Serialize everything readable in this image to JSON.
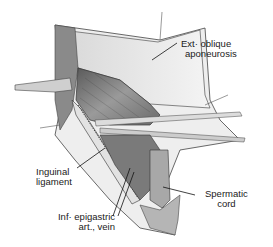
{
  "figure": {
    "labels": [
      {
        "id": "ext-oblique",
        "lines": [
          "Ext· oblique",
          "aponeurosis"
        ]
      },
      {
        "id": "inguinal-ligament",
        "lines": [
          "Inguinal",
          "ligament"
        ]
      },
      {
        "id": "spermatic-cord",
        "lines": [
          "Spermatic",
          "cord"
        ]
      },
      {
        "id": "inf-epigastric",
        "lines": [
          "Inf· epigastric",
          "art., vein"
        ]
      }
    ]
  }
}
